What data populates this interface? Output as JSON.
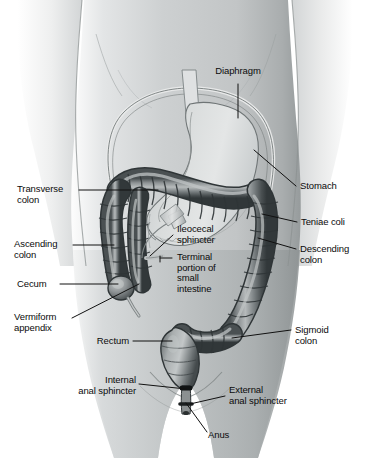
{
  "figure": {
    "background_color": "#ffffff",
    "body_fill": "#b9bcbd",
    "body_highlight": "#eceded",
    "colon_fill": "#6e7476",
    "colon_dark": "#3c4143",
    "stomach_fill": "#cfd2d3",
    "leader_color": "#111111",
    "text_color": "#0b0b0b"
  },
  "labels": [
    {
      "id": "diaphragm",
      "text": "Diaphragm",
      "align": "center"
    },
    {
      "id": "stomach",
      "text": "Stomach",
      "align": "left"
    },
    {
      "id": "teniae-coli",
      "text": "Teniae coli",
      "align": "left"
    },
    {
      "id": "descending-colon",
      "text": "Descending\ncolon",
      "align": "left"
    },
    {
      "id": "sigmoid-colon",
      "text": "Sigmoid\ncolon",
      "align": "left"
    },
    {
      "id": "external-anal-sphincter",
      "text": "External\nanal sphincter",
      "align": "left"
    },
    {
      "id": "anus",
      "text": "Anus",
      "align": "left"
    },
    {
      "id": "internal-anal-sphincter",
      "text": "Internal\nanal sphincter",
      "align": "right"
    },
    {
      "id": "rectum",
      "text": "Rectum",
      "align": "right"
    },
    {
      "id": "vermiform-appendix",
      "text": "Vermiform\nappendix",
      "align": "left"
    },
    {
      "id": "cecum",
      "text": "Cecum",
      "align": "left"
    },
    {
      "id": "ascending-colon",
      "text": "Ascending\ncolon",
      "align": "left"
    },
    {
      "id": "transverse-colon",
      "text": "Transverse\ncolon",
      "align": "left"
    },
    {
      "id": "ileocecal-sphincter",
      "text": "Ileocecal\nsphincter",
      "align": "left"
    },
    {
      "id": "terminal-portion",
      "text": "Terminal\nportion of\nsmall\nintestine",
      "align": "left"
    }
  ],
  "structures": [
    {
      "id": "torso",
      "name": "human torso silhouette"
    },
    {
      "id": "stomach",
      "name": "stomach"
    },
    {
      "id": "esophagus",
      "name": "esophagus"
    },
    {
      "id": "diaphragm-outline",
      "name": "diaphragm outline"
    },
    {
      "id": "transverse-colon",
      "name": "transverse colon"
    },
    {
      "id": "ascending-colon",
      "name": "ascending colon"
    },
    {
      "id": "descending-colon",
      "name": "descending colon"
    },
    {
      "id": "sigmoid-colon",
      "name": "sigmoid colon"
    },
    {
      "id": "cecum",
      "name": "cecum"
    },
    {
      "id": "vermiform-appendix",
      "name": "vermiform appendix"
    },
    {
      "id": "ileum",
      "name": "terminal ileum"
    },
    {
      "id": "rectum",
      "name": "rectum"
    },
    {
      "id": "anal-canal",
      "name": "anal canal"
    }
  ]
}
